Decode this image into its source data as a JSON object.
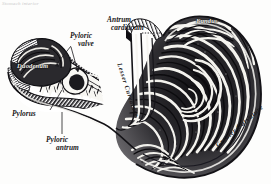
{
  "plate": {
    "caption": "Stomach interior",
    "background_color": "#fdfdfc",
    "ink_color": "#19181a",
    "width": 271,
    "height": 184,
    "medium": "engraving",
    "subject": "Interior of the stomach, sectioned to show rugae"
  },
  "labels": {
    "antrum_cardiacum": {
      "line1": "Antrum",
      "line2": "cardiacum"
    },
    "pyloric_valve": {
      "line1": "Pyloric",
      "line2": "valve"
    },
    "pylorus": {
      "line1": "Pylorus"
    },
    "pyloric_antrum": {
      "line1": "Pyloric",
      "line2": "antrum"
    },
    "duodenum": {
      "line1": "Duodenum"
    },
    "fundus": {
      "line1": "Fundus"
    },
    "lesser_curvature": {
      "line1": "Lesser Curvature"
    },
    "greater_curvature": {
      "line1": "Greater Curvature"
    }
  }
}
